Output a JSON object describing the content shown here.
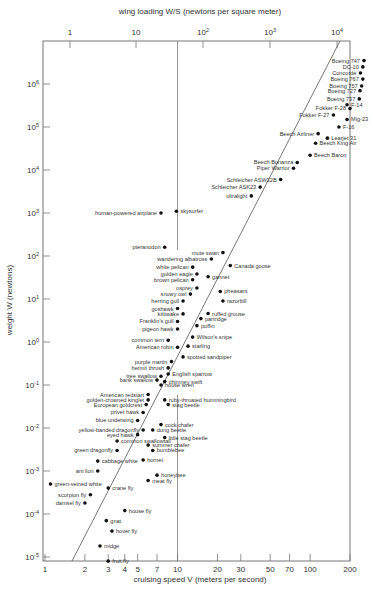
{
  "chart_data": {
    "type": "scatter",
    "title": "",
    "xlabel": "cruising speed V (meters per second)",
    "ylabel": "weight W (newtons)",
    "x2label": "wing loading W/S (newtons per square meter)",
    "xscale": "log",
    "yscale": "log",
    "xlim": [
      1,
      200
    ],
    "ylim": [
      1e-05,
      10000000
    ],
    "x_ticks": [
      "1",
      "2",
      "3",
      "4",
      "5",
      "7",
      "10",
      "20",
      "30",
      "50",
      "70",
      "100",
      "200"
    ],
    "x_tick_values": [
      1,
      2,
      3,
      4,
      5,
      7,
      10,
      20,
      30,
      50,
      70,
      100,
      200
    ],
    "y_ticks": [
      "10^-5",
      "10^-4",
      "10^-3",
      "10^-2",
      "10^-1",
      "10^0",
      "10^1",
      "10^2",
      "10^3",
      "10^4",
      "10^5",
      "10^6"
    ],
    "x2_ticks": [
      "1",
      "10",
      "10^2",
      "10^3",
      "10^4"
    ],
    "grid": false,
    "legend": null,
    "points": [
      {
        "label": "Boeing 747",
        "x": 255,
        "y": 3500000
      },
      {
        "label": "DC-10",
        "x": 250,
        "y": 2500000
      },
      {
        "label": "Concorde",
        "x": 240,
        "y": 1800000
      },
      {
        "label": "Boeing 767",
        "x": 250,
        "y": 1300000
      },
      {
        "label": "Boeing 757",
        "x": 245,
        "y": 900000
      },
      {
        "label": "Boeing 727",
        "x": 238,
        "y": 700000
      },
      {
        "label": "Boeing 737",
        "x": 235,
        "y": 450000
      },
      {
        "label": "F-14",
        "x": 190,
        "y": 330000
      },
      {
        "label": "Fokker F-28",
        "x": 200,
        "y": 270000
      },
      {
        "label": "Fokker F-27",
        "x": 150,
        "y": 190000
      },
      {
        "label": "Mig-23",
        "x": 190,
        "y": 150000
      },
      {
        "label": "F-16",
        "x": 165,
        "y": 100000
      },
      {
        "label": "Beech Airliner",
        "x": 115,
        "y": 70000
      },
      {
        "label": "Learjet 31",
        "x": 135,
        "y": 55000
      },
      {
        "label": "Beech King Air",
        "x": 110,
        "y": 42000
      },
      {
        "label": "Beech Baron",
        "x": 100,
        "y": 22000
      },
      {
        "label": "Beech Bonanza",
        "x": 80,
        "y": 15000
      },
      {
        "label": "Piper Warrior",
        "x": 75,
        "y": 11000
      },
      {
        "label": "Schleicher ASW22B",
        "x": 60,
        "y": 6000
      },
      {
        "label": "Schleicher ASK23",
        "x": 42,
        "y": 4000
      },
      {
        "label": "ultralight",
        "x": 36,
        "y": 2500
      },
      {
        "label": "skysurfer",
        "x": 9.8,
        "y": 1100
      },
      {
        "label": "human-powered airplane",
        "x": 7.5,
        "y": 1000
      },
      {
        "label": "pteranodon",
        "x": 8,
        "y": 160
      },
      {
        "label": "mute swan",
        "x": 22,
        "y": 120
      },
      {
        "label": "wandering albatross",
        "x": 18,
        "y": 85
      },
      {
        "label": "Canada goose",
        "x": 25,
        "y": 60
      },
      {
        "label": "white pelican",
        "x": 13,
        "y": 55
      },
      {
        "label": "gannet",
        "x": 17,
        "y": 33
      },
      {
        "label": "golden eagle",
        "x": 14,
        "y": 38
      },
      {
        "label": "brown pelican",
        "x": 13,
        "y": 28
      },
      {
        "label": "osprey",
        "x": 14,
        "y": 18
      },
      {
        "label": "pheasant",
        "x": 21,
        "y": 15
      },
      {
        "label": "snowy owl",
        "x": 12.5,
        "y": 13
      },
      {
        "label": "razorbill",
        "x": 22,
        "y": 9
      },
      {
        "label": "herring gull",
        "x": 11,
        "y": 9
      },
      {
        "label": "goshawk",
        "x": 10,
        "y": 6
      },
      {
        "label": "kittiwake",
        "x": 11,
        "y": 4.5
      },
      {
        "label": "ruffed grouse",
        "x": 17,
        "y": 4.6
      },
      {
        "label": "partridge",
        "x": 15,
        "y": 3.5
      },
      {
        "label": "Franklin's gull",
        "x": 10,
        "y": 3
      },
      {
        "label": "puffin",
        "x": 14,
        "y": 2.4
      },
      {
        "label": "pigeon hawk",
        "x": 10,
        "y": 2
      },
      {
        "label": "Wilson's snipe",
        "x": 13,
        "y": 1.3
      },
      {
        "label": "common tern",
        "x": 8.5,
        "y": 1.1
      },
      {
        "label": "starling",
        "x": 12,
        "y": 0.8
      },
      {
        "label": "American robin",
        "x": 10,
        "y": 0.75
      },
      {
        "label": "spotted sandpiper",
        "x": 11,
        "y": 0.45
      },
      {
        "label": "purple martin",
        "x": 9,
        "y": 0.35
      },
      {
        "label": "hermit thrush",
        "x": 8.5,
        "y": 0.25
      },
      {
        "label": "tree swallow",
        "x": 7.5,
        "y": 0.16
      },
      {
        "label": "English sparrow",
        "x": 8.5,
        "y": 0.18
      },
      {
        "label": "bank swallow",
        "x": 7,
        "y": 0.13
      },
      {
        "label": "chimney swift",
        "x": 8,
        "y": 0.12
      },
      {
        "label": "house wren",
        "x": 7.5,
        "y": 0.1
      },
      {
        "label": "American redstart",
        "x": 6,
        "y": 0.06
      },
      {
        "label": "golden-crowned kinglet",
        "x": 6,
        "y": 0.045
      },
      {
        "label": "ruby-throated hummingbird",
        "x": 8,
        "y": 0.045
      },
      {
        "label": "European goldcrest",
        "x": 5.8,
        "y": 0.035
      },
      {
        "label": "stag beetle",
        "x": 8.5,
        "y": 0.035
      },
      {
        "label": "privet hawk",
        "x": 5.5,
        "y": 0.023
      },
      {
        "label": "blue underwing",
        "x": 5,
        "y": 0.015
      },
      {
        "label": "cock chafer",
        "x": 7.5,
        "y": 0.012
      },
      {
        "label": "yellow-banded dragonfly",
        "x": 5.5,
        "y": 0.009
      },
      {
        "label": "dung beetle",
        "x": 6.5,
        "y": 0.009
      },
      {
        "label": "eyed hawk",
        "x": 5,
        "y": 0.007
      },
      {
        "label": "little stag beetle",
        "x": 8,
        "y": 0.006
      },
      {
        "label": "common swallowtail",
        "x": 3.5,
        "y": 0.005
      },
      {
        "label": "summer chafer",
        "x": 6,
        "y": 0.004
      },
      {
        "label": "bumblebee",
        "x": 6.5,
        "y": 0.003
      },
      {
        "label": "green dragonfly",
        "x": 3.5,
        "y": 0.003
      },
      {
        "label": "hornet",
        "x": 5.5,
        "y": 0.0018
      },
      {
        "label": "cabbage white",
        "x": 2.5,
        "y": 0.0017
      },
      {
        "label": "ant lion",
        "x": 2.5,
        "y": 0.001
      },
      {
        "label": "honeybee",
        "x": 7,
        "y": 0.0008
      },
      {
        "label": "meat fly",
        "x": 6,
        "y": 0.0006
      },
      {
        "label": "green-veined white",
        "x": 1.1,
        "y": 0.0005
      },
      {
        "label": "crane fly",
        "x": 3,
        "y": 0.0004
      },
      {
        "label": "scorpion fly",
        "x": 2.2,
        "y": 0.00028
      },
      {
        "label": "damsel fly",
        "x": 2,
        "y": 0.00018
      },
      {
        "label": "house fly",
        "x": 4,
        "y": 0.00012
      },
      {
        "label": "gnat",
        "x": 2.9,
        "y": 7e-05
      },
      {
        "label": "hover fly",
        "x": 3.2,
        "y": 4e-05
      },
      {
        "label": "midge",
        "x": 2.6,
        "y": 1.8e-05
      },
      {
        "label": "fruit fly",
        "x": 3,
        "y": 8e-06
      }
    ],
    "annotations": [
      "fitted power-law line from lower-left to upper-right",
      "vertical reference line at V = 10 m/s"
    ]
  }
}
